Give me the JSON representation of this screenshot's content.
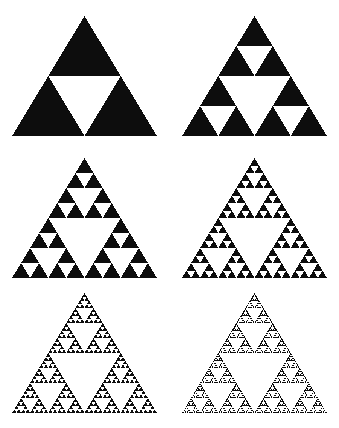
{
  "figure": {
    "title": "",
    "background_color": "#ffffff",
    "shape_color": "#0d0d0d",
    "grid": {
      "rows": 3,
      "columns": 2
    }
  },
  "chart_data": {
    "type": "diagram",
    "title": "",
    "subtitle": "",
    "xlabel": "",
    "ylabel": "",
    "legend": [],
    "grid": false,
    "panels": [
      {
        "index": 0,
        "name": "sierpinski-iteration-1",
        "iteration": 1,
        "filled_triangles": 3,
        "holes": 1,
        "row": 0,
        "column": 0,
        "left": 12,
        "top": 16,
        "width": 145,
        "height": 120,
        "apex_x": 84.5,
        "base_y": 136
      },
      {
        "index": 1,
        "name": "sierpinski-iteration-2",
        "iteration": 2,
        "filled_triangles": 9,
        "holes": 4,
        "row": 0,
        "column": 1,
        "left": 182,
        "top": 16,
        "width": 145,
        "height": 120,
        "apex_x": 254.5,
        "base_y": 136
      },
      {
        "index": 2,
        "name": "sierpinski-iteration-3",
        "iteration": 3,
        "filled_triangles": 27,
        "holes": 13,
        "row": 1,
        "column": 0,
        "left": 12,
        "top": 158,
        "width": 145,
        "height": 120,
        "apex_x": 84.5,
        "base_y": 278
      },
      {
        "index": 3,
        "name": "sierpinski-iteration-4",
        "iteration": 4,
        "filled_triangles": 81,
        "holes": 40,
        "row": 1,
        "column": 1,
        "left": 182,
        "top": 158,
        "width": 145,
        "height": 120,
        "apex_x": 254.5,
        "base_y": 278
      },
      {
        "index": 4,
        "name": "sierpinski-iteration-5",
        "iteration": 5,
        "filled_triangles": 243,
        "holes": 121,
        "row": 2,
        "column": 0,
        "left": 12,
        "top": 293,
        "width": 145,
        "height": 120,
        "apex_x": 84.5,
        "base_y": 413
      },
      {
        "index": 5,
        "name": "sierpinski-iteration-6",
        "iteration": 6,
        "filled_triangles": 729,
        "holes": 364,
        "row": 2,
        "column": 1,
        "left": 182,
        "top": 293,
        "width": 145,
        "height": 120,
        "apex_x": 254.5,
        "base_y": 413
      }
    ]
  }
}
